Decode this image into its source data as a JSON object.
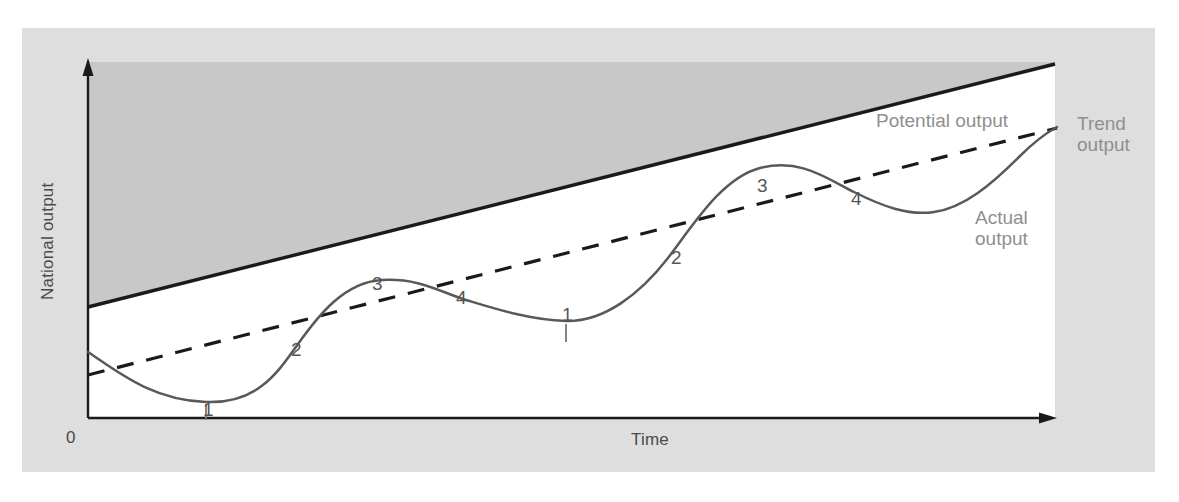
{
  "figure": {
    "background_color": "#ffffff",
    "frame_color": "#dedede",
    "shaded_band_color": "#c8c8c8",
    "plot_area_color": "#ffffff",
    "axis_color": "#1a1a1a",
    "curve_color": "#595959",
    "label_color": "#8f8f8f"
  },
  "axes": {
    "y_title": "National output",
    "x_title": "Time",
    "origin_label": "0",
    "y_arrow": true,
    "x_arrow": true
  },
  "labels": {
    "potential_output": "Potential output",
    "trend_output_line1": "Trend",
    "trend_output_line2": "output",
    "actual_output_line1": "Actual",
    "actual_output_line2": "output"
  },
  "phase_markers": [
    {
      "label": "1",
      "x": 203,
      "y": 400,
      "tick": true,
      "tick_x": 206,
      "tick_y1": 400,
      "tick_y2": 418
    },
    {
      "label": "2",
      "x": 291,
      "y": 340,
      "tick": false,
      "tick_x": 0,
      "tick_y1": 0,
      "tick_y2": 0
    },
    {
      "label": "3",
      "x": 372,
      "y": 274,
      "tick": false,
      "tick_x": 0,
      "tick_y1": 0,
      "tick_y2": 0
    },
    {
      "label": "4",
      "x": 456,
      "y": 288,
      "tick": false,
      "tick_x": 0,
      "tick_y1": 0,
      "tick_y2": 0
    },
    {
      "label": "1",
      "x": 562,
      "y": 305,
      "tick": true,
      "tick_x": 566,
      "tick_y1": 310,
      "tick_y2": 328
    },
    {
      "label": "2",
      "x": 671,
      "y": 248,
      "tick": false,
      "tick_x": 0,
      "tick_y1": 0,
      "tick_y2": 0
    },
    {
      "label": "3",
      "x": 757,
      "y": 176,
      "tick": false,
      "tick_x": 0,
      "tick_y1": 0,
      "tick_y2": 0
    },
    {
      "label": "4",
      "x": 851,
      "y": 189,
      "tick": false,
      "tick_x": 0,
      "tick_y1": 0,
      "tick_y2": 0
    }
  ],
  "chart_data": {
    "type": "line",
    "xlabel": "Time",
    "ylabel": "National output",
    "grid": false,
    "legend": "inline-annotations",
    "xlim": [
      0,
      100
    ],
    "ylim": [
      0,
      100
    ],
    "axis_ticks": {
      "x": [
        "0"
      ],
      "y": []
    },
    "annotations": [
      "Potential output",
      "Trend output",
      "Actual output",
      "1 = trough",
      "2 = recovery / expansion",
      "3 = peak / boom",
      "4 = slowdown / recession"
    ],
    "series": [
      {
        "name": "Potential output",
        "style": "solid-thick",
        "color": "#1a1a1a",
        "description": "Straight upward-sloping ceiling line; top boundary of the shaded region",
        "x": [
          0,
          100
        ],
        "y": [
          36,
          93
        ]
      },
      {
        "name": "Trend output",
        "style": "dashed",
        "color": "#1a1a1a",
        "description": "Straight upward-sloping dashed line below potential output",
        "x": [
          0,
          100
        ],
        "y": [
          18,
          82
        ]
      },
      {
        "name": "Actual output",
        "style": "solid-thin",
        "color": "#595959",
        "description": "Wavy cyclical curve oscillating about the trend line, two full cycles",
        "x": [
          0,
          4,
          8,
          12,
          16,
          20,
          24,
          28,
          32,
          36,
          40,
          44,
          48,
          52,
          56,
          60,
          64,
          68,
          72,
          76,
          80,
          84,
          88,
          92,
          96,
          100
        ],
        "y": [
          23,
          17,
          12,
          9,
          8,
          9,
          13,
          19,
          26,
          32,
          36,
          38,
          38,
          36,
          33,
          30,
          29,
          31,
          37,
          46,
          55,
          63,
          68,
          69,
          66,
          64
        ]
      }
    ],
    "cycle_phase_labels": {
      "1": "trough",
      "2": "expansion (crossing trend upward)",
      "3": "peak",
      "4": "contraction (crossing trend downward)"
    }
  }
}
